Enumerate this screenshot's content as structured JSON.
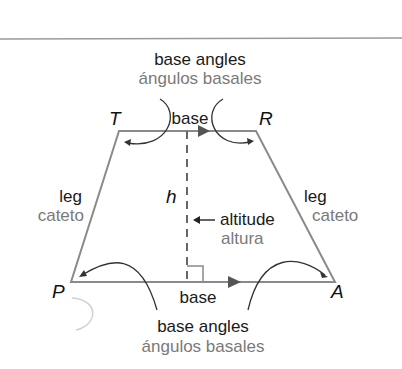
{
  "diagram": {
    "colors": {
      "shape_stroke": "#8a8a8a",
      "english_text": "#1a1a1a",
      "spanish_text": "#7a7a7a",
      "arrow": "#333333"
    },
    "vertices": {
      "T": "T",
      "R": "R",
      "P": "P",
      "A": "A"
    },
    "top_labels": {
      "en": "base angles",
      "es": "ángulos basales"
    },
    "bottom_labels": {
      "en": "base angles",
      "es": "ángulos basales"
    },
    "top_base": "base",
    "bottom_base": "base",
    "left_leg": {
      "en": "leg",
      "es": "cateto"
    },
    "right_leg": {
      "en": "leg",
      "es": "cateto"
    },
    "height_symbol": "h",
    "altitude": {
      "en": "altitude",
      "es": "altura",
      "arrow": "←"
    }
  }
}
